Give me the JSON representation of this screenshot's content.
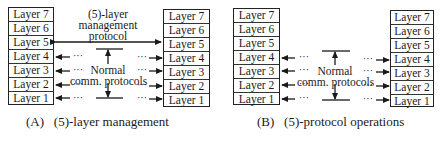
{
  "layers": [
    "Layer 7",
    "Layer 6",
    "Layer 5",
    "Layer 4",
    "Layer 3",
    "Layer 2",
    "Layer 1"
  ],
  "panel_a": {
    "top_label": [
      "(5)-layer",
      "management",
      "protocol"
    ],
    "middle_label": [
      "Normal",
      "comm. protocols"
    ],
    "caption": "(A)   (5)-layer management"
  },
  "panel_b": {
    "middle_label": [
      "Normal",
      "comm. protocols"
    ],
    "caption": "(B)   (5)-protocol operations"
  },
  "ellipsis": "···",
  "colors": {
    "line": "#1a1a1a",
    "background": "#ffffff"
  }
}
